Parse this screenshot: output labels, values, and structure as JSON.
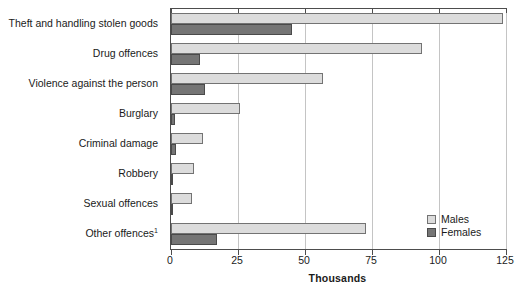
{
  "chart_data": {
    "type": "bar",
    "orientation": "horizontal",
    "title": "",
    "xlabel": "Thousands",
    "ylabel": "",
    "xlim": [
      0,
      125
    ],
    "xticks": [
      0,
      25,
      50,
      75,
      100,
      125
    ],
    "xtick_labels": [
      "0",
      "25",
      "50",
      "75",
      "100",
      "125"
    ],
    "grid": true,
    "grid_axis": "x",
    "legend_position": "lower right",
    "categories": [
      "Theft and handling stolen goods",
      "Drug offences",
      "Violence against the person",
      "Burglary",
      "Criminal damage",
      "Robbery",
      "Sexual offences",
      "Other offences"
    ],
    "category_footnotes": [
      "",
      "",
      "",
      "",
      "",
      "",
      "",
      "1"
    ],
    "series": [
      {
        "name": "Males",
        "color": "#dcdcdc",
        "edge_color": "#737373",
        "values": [
          124.0,
          93.5,
          56.7,
          25.7,
          12.0,
          8.6,
          7.8,
          72.8
        ]
      },
      {
        "name": "Females",
        "color": "#757575",
        "edge_color": "#4a4a4a",
        "values": [
          45.0,
          10.8,
          12.7,
          1.5,
          2.0,
          0.7,
          0.3,
          17.2
        ]
      }
    ]
  },
  "legend": {
    "entries": [
      {
        "label": "Males"
      },
      {
        "label": "Females"
      }
    ]
  },
  "axis": {
    "x_title": "Thousands"
  },
  "colors": {
    "males": "#dcdcdc",
    "females": "#757575",
    "grid": "#c4c4c4",
    "axis": "#4d4d4d",
    "text": "#1a1a1a"
  }
}
